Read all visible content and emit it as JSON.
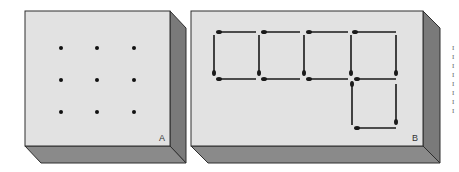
{
  "panels": [
    {
      "id": "A",
      "label": "A",
      "face": {
        "x": 25,
        "y": 11,
        "w": 145,
        "h": 135
      },
      "depth": {
        "dx": 16,
        "dy": 17
      },
      "dots": [
        [
          61,
          48
        ],
        [
          97,
          48
        ],
        [
          134,
          48
        ],
        [
          61,
          80
        ],
        [
          97,
          80
        ],
        [
          134,
          80
        ],
        [
          61,
          112
        ],
        [
          97,
          112
        ],
        [
          134,
          112
        ]
      ]
    },
    {
      "id": "B",
      "label": "B",
      "face": {
        "x": 191,
        "y": 11,
        "w": 232,
        "h": 135
      },
      "depth": {
        "dx": 17,
        "dy": 17
      },
      "matches": [
        {
          "x1": 219,
          "y1": 32,
          "x2": 256,
          "y2": 32,
          "head": "start"
        },
        {
          "x1": 264,
          "y1": 32,
          "x2": 300,
          "y2": 32,
          "head": "start"
        },
        {
          "x1": 309,
          "y1": 32,
          "x2": 348,
          "y2": 32,
          "head": "start"
        },
        {
          "x1": 355,
          "y1": 32,
          "x2": 396,
          "y2": 32,
          "head": "start"
        },
        {
          "x1": 214,
          "y1": 35,
          "x2": 214,
          "y2": 73,
          "head": "end"
        },
        {
          "x1": 259,
          "y1": 35,
          "x2": 259,
          "y2": 73,
          "head": "end"
        },
        {
          "x1": 304,
          "y1": 35,
          "x2": 304,
          "y2": 73,
          "head": "end"
        },
        {
          "x1": 351,
          "y1": 35,
          "x2": 351,
          "y2": 73,
          "head": "end"
        },
        {
          "x1": 396,
          "y1": 35,
          "x2": 396,
          "y2": 73,
          "head": "end"
        },
        {
          "x1": 219,
          "y1": 79,
          "x2": 256,
          "y2": 79,
          "head": "start"
        },
        {
          "x1": 264,
          "y1": 79,
          "x2": 300,
          "y2": 79,
          "head": "start"
        },
        {
          "x1": 309,
          "y1": 79,
          "x2": 348,
          "y2": 79,
          "head": "start"
        },
        {
          "x1": 357,
          "y1": 79,
          "x2": 396,
          "y2": 79,
          "head": "start"
        },
        {
          "x1": 352,
          "y1": 84,
          "x2": 352,
          "y2": 125,
          "head": "start"
        },
        {
          "x1": 396,
          "y1": 84,
          "x2": 396,
          "y2": 122,
          "head": "end"
        },
        {
          "x1": 357,
          "y1": 128,
          "x2": 396,
          "y2": 128,
          "head": "start"
        }
      ]
    }
  ],
  "colors": {
    "face": "#e2e2e2",
    "side": "#7a7a7a",
    "bottom": "#8a8a8a",
    "edge": "#2e2e2e",
    "dot": "#111111",
    "match": "#1a1a1a"
  },
  "margin_text_fragments": [
    "I",
    "I",
    "I",
    "I",
    "I",
    "I",
    "I",
    "I"
  ]
}
